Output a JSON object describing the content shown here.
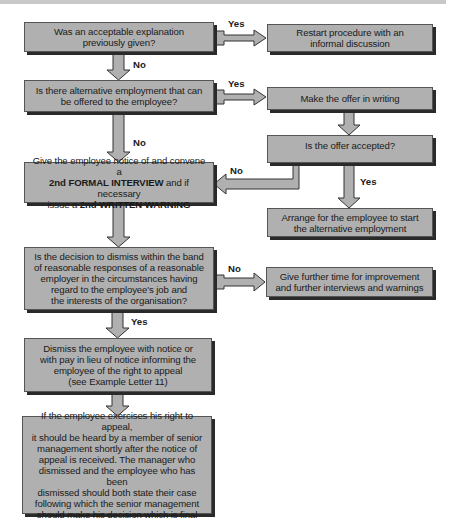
{
  "diagram": {
    "nodes": {
      "q_explanation": {
        "lines": [
          "Was an acceptable explanation",
          "previously given?"
        ]
      },
      "restart": {
        "lines": [
          "Restart procedure with an",
          "informal discussion"
        ]
      },
      "q_alternative": {
        "lines": [
          "Is there alternative employment that can",
          "be offered to the employee?"
        ]
      },
      "offer_writing": {
        "lines": [
          "Make the offer in writing"
        ]
      },
      "q_offer_accepted": {
        "lines": [
          "Is the offer accepted?"
        ]
      },
      "second_interview": {
        "line1": "Give the employee notice of and convene a",
        "line2_bold": "2nd FORMAL INTERVIEW",
        "line2_rest": " and if necessary",
        "line3_pre": "issue a ",
        "line3_bold": "2nd WRITTEN WARNING"
      },
      "arrange_alt": {
        "lines": [
          "Arrange for the employee to start",
          "the alternative employment"
        ]
      },
      "q_band": {
        "lines": [
          "Is the decision to dismiss within the band",
          "of reasonable responses of a reasonable",
          "employer in the circumstances having",
          "regard to the employee's job and",
          "the interests of the organisation?"
        ]
      },
      "further_time": {
        "lines": [
          "Give further time for improvement",
          "and further interviews and warnings"
        ]
      },
      "dismiss": {
        "lines": [
          "Dismiss the employee with notice or",
          "with pay in lieu of notice informing the",
          "employee of the right to appeal",
          "(see Example Letter 11)"
        ]
      },
      "appeal": {
        "lines": [
          "If the employee exercises his right to appeal,",
          "it should be heard by a member of senior",
          "management shortly after the notice of",
          "appeal is received. The manager who",
          "dismissed and the employee who has been",
          "dismissed should both state their case",
          "following which the senior management",
          "should make his decision which is final"
        ]
      }
    },
    "edge_labels": {
      "explanation_yes": "Yes",
      "explanation_no": "No",
      "alternative_yes": "Yes",
      "alternative_no": "No",
      "offer_no": "No",
      "offer_yes": "Yes",
      "band_no": "No",
      "band_yes": "Yes"
    },
    "colors": {
      "box_fill": "#b0b0b0",
      "box_shadow": "#2a2a2a",
      "arrow_fill": "#b0b0b0",
      "arrow_stroke": "#333333"
    }
  }
}
